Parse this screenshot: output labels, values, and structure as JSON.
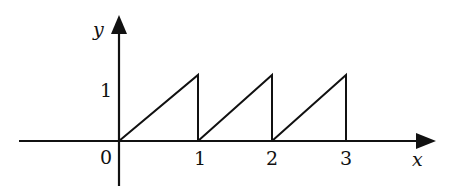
{
  "diagram": {
    "type": "sawtooth-function-graph",
    "axes": {
      "x_label": "x",
      "y_label": "y",
      "origin_label": "0"
    },
    "x_ticks": [
      "1",
      "2",
      "3"
    ],
    "y_ticks": [
      "1"
    ],
    "segments": [
      {
        "from": [
          0,
          0
        ],
        "to": [
          1,
          1
        ],
        "drop_at": 1
      },
      {
        "from": [
          1,
          0
        ],
        "to": [
          2,
          1
        ],
        "drop_at": 2
      },
      {
        "from": [
          2,
          0
        ],
        "to": [
          3,
          1
        ],
        "drop_at": 3
      }
    ],
    "colors": {
      "stroke": "#111111",
      "background": "#ffffff"
    }
  }
}
